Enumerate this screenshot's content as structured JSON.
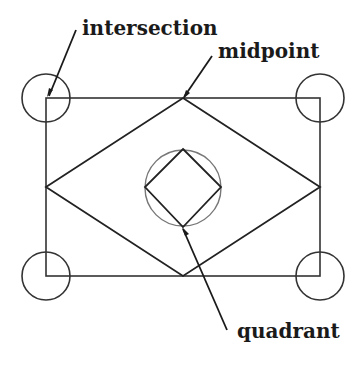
{
  "diagram": {
    "title": "",
    "type": "object snap illustration",
    "colors": {
      "line": "#2a2a2a",
      "snap_circle": "#555555",
      "label": "#1a1a1a",
      "background": "#ffffff"
    },
    "labels": {
      "intersection": "intersection",
      "midpoint": "midpoint",
      "quadrant": "quadrant"
    },
    "shapes": {
      "rectangle": {
        "x1": 46,
        "y1": 98,
        "x2": 320,
        "y2": 276
      },
      "outer_diamond": {
        "top": [
          183,
          98
        ],
        "right": [
          320,
          187
        ],
        "bottom": [
          183,
          276
        ],
        "left": [
          46,
          187
        ]
      },
      "inner_circle": {
        "cx": 183,
        "cy": 188,
        "r": 38
      },
      "inner_diamond": {
        "top": [
          183,
          149
        ],
        "right": [
          221,
          187
        ],
        "bottom": [
          183,
          227
        ],
        "left": [
          145,
          187
        ]
      },
      "corner_circles": [
        {
          "cx": 46,
          "cy": 98,
          "r": 24
        },
        {
          "cx": 320,
          "cy": 98,
          "r": 24
        },
        {
          "cx": 46,
          "cy": 276,
          "r": 24
        },
        {
          "cx": 320,
          "cy": 276,
          "r": 24
        }
      ]
    }
  }
}
